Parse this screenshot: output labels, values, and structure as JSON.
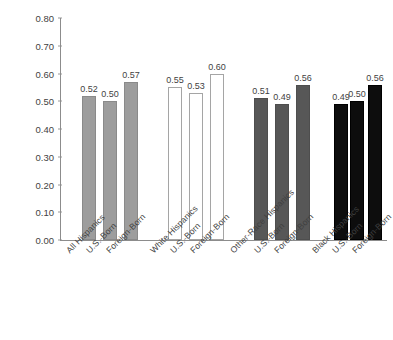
{
  "chart_data": {
    "type": "bar",
    "title": "",
    "xlabel": "",
    "ylabel": "Dissimilarity Score",
    "ylim": [
      0.0,
      0.8
    ],
    "ytick_labels": [
      "0.80",
      "0.70",
      "0.60",
      "0.50",
      "0.40",
      "0.30",
      "0.20",
      "0.10",
      "0.00"
    ],
    "ytick_values": [
      0.8,
      0.7,
      0.6,
      0.5,
      0.4,
      0.3,
      0.2,
      0.1,
      0.0
    ],
    "grid": false,
    "legend": "none",
    "categories": [
      "All Hispanics",
      "U.S.-Born",
      "Foreign-Born",
      "White Hispanics",
      "U.S.-Born",
      "Foreign-Born",
      "Other-Race Hispanics",
      "U.S.-Born",
      "Foreign-Born",
      "Black Hispanics",
      "U.S.-Born",
      "Foreign-Born"
    ],
    "values": [
      0.52,
      0.5,
      0.57,
      0.55,
      0.53,
      0.6,
      0.51,
      0.49,
      0.56,
      0.49,
      0.5,
      0.56
    ],
    "value_labels": [
      "0.52",
      "0.50",
      "0.57",
      "0.55",
      "0.53",
      "0.60",
      "0.51",
      "0.49",
      "0.56",
      "0.49",
      "0.50",
      "0.56"
    ],
    "groups": [
      {
        "name": "All Hispanics",
        "style": "fill-mid",
        "color": "#9d9d9d",
        "bars": [
          {
            "label": "All Hispanics",
            "value": 0.52,
            "value_label": "0.52"
          },
          {
            "label": "U.S.-Born",
            "value": 0.5,
            "value_label": "0.50"
          },
          {
            "label": "Foreign-Born",
            "value": 0.57,
            "value_label": "0.57"
          }
        ]
      },
      {
        "name": "White Hispanics",
        "style": "fill-white",
        "color": "#ffffff",
        "bars": [
          {
            "label": "White Hispanics",
            "value": 0.55,
            "value_label": "0.55"
          },
          {
            "label": "U.S.-Born",
            "value": 0.53,
            "value_label": "0.53"
          },
          {
            "label": "Foreign-Born",
            "value": 0.6,
            "value_label": "0.60"
          }
        ]
      },
      {
        "name": "Other-Race Hispanics",
        "style": "fill-dark",
        "color": "#575757",
        "bars": [
          {
            "label": "Other-Race Hispanics",
            "value": 0.51,
            "value_label": "0.51"
          },
          {
            "label": "U.S.-Born",
            "value": 0.49,
            "value_label": "0.49"
          },
          {
            "label": "Foreign-Born",
            "value": 0.56,
            "value_label": "0.56"
          }
        ]
      },
      {
        "name": "Black Hispanics",
        "style": "fill-black",
        "color": "#0d0d0d",
        "bars": [
          {
            "label": "Black Hispanics",
            "value": 0.49,
            "value_label": "0.49"
          },
          {
            "label": "U.S.-Born",
            "value": 0.5,
            "value_label": "0.50"
          },
          {
            "label": "Foreign-Born",
            "value": 0.56,
            "value_label": "0.56"
          }
        ]
      }
    ]
  },
  "layout": {
    "bar_x_centers": [
      89,
      110,
      131,
      175,
      196,
      217,
      261,
      282,
      303,
      341,
      357,
      375
    ],
    "bar_width": 14,
    "label_x_anchors": [
      64,
      84,
      104,
      148,
      168,
      188,
      228,
      252,
      272,
      310,
      330,
      350
    ]
  }
}
